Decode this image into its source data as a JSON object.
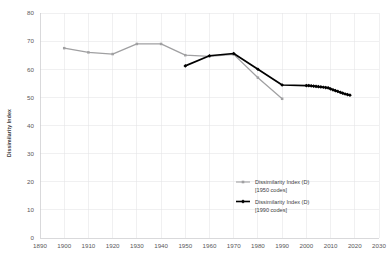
{
  "chart_data": {
    "type": "line",
    "title": "",
    "xlabel": "",
    "ylabel": "Dissimilarity Index",
    "xlim": [
      1890,
      2030
    ],
    "ylim": [
      0,
      80
    ],
    "grid": true,
    "legend_position": "inside-bottom-right",
    "xticks": [
      "1890",
      "1900",
      "1910",
      "1920",
      "1930",
      "1940",
      "1950",
      "1960",
      "1970",
      "1980",
      "1990",
      "2000",
      "2010",
      "2020",
      "2030"
    ],
    "yticks": [
      "0",
      "10",
      "20",
      "30",
      "40",
      "50",
      "60",
      "70",
      "80"
    ],
    "series": [
      {
        "name": "Dissimilarity Index (D) [1950 codes]",
        "legend_line1": "Dissimilarity Index (D)",
        "legend_line2": "[1950 codes]",
        "color": "#a0a0a2",
        "marker": "square",
        "x": [
          1900,
          1910,
          1920,
          1930,
          1940,
          1950,
          1960,
          1970,
          1980,
          1990
        ],
        "values": [
          67.5,
          66.0,
          65.4,
          69.0,
          69.0,
          65.0,
          64.6,
          65.3,
          57.0,
          49.5
        ]
      },
      {
        "name": "Dissimilarity Index (D) [1990 codes]",
        "legend_line1": "Dissimilarity Index (D)",
        "legend_line2": "[1990 codes]",
        "color": "#000000",
        "marker": "diamond",
        "x": [
          1950,
          1960,
          1970,
          1980,
          1990,
          2000,
          2001,
          2002,
          2003,
          2004,
          2005,
          2006,
          2007,
          2008,
          2009,
          2010,
          2011,
          2012,
          2013,
          2014,
          2015,
          2016,
          2017,
          2018
        ],
        "values": [
          61.2,
          64.8,
          65.6,
          60.0,
          54.4,
          54.2,
          54.2,
          54.1,
          54.0,
          53.9,
          53.8,
          53.7,
          53.6,
          53.5,
          53.4,
          53.0,
          52.7,
          52.4,
          52.1,
          51.8,
          51.5,
          51.2,
          51.0,
          50.8
        ]
      }
    ]
  }
}
